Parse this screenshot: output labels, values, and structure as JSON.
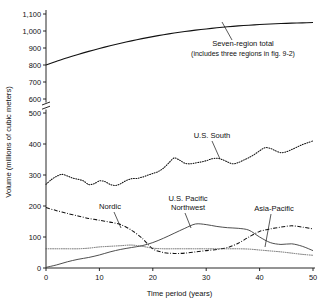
{
  "chart_data": {
    "type": "line",
    "title": "",
    "xlabel": "Time period (years)",
    "ylabel": "Volume (millions of cubic meters)",
    "xlim": [
      0,
      50
    ],
    "xticks": [
      "0",
      "10",
      "20",
      "30",
      "40",
      "50"
    ],
    "xtick_values": [
      0,
      10,
      20,
      30,
      40,
      50
    ],
    "yticks_lower": [
      "0",
      "100",
      "200",
      "300",
      "400",
      "500"
    ],
    "ytick_values_lower": [
      0,
      100,
      200,
      300,
      400,
      500
    ],
    "yticks_upper": [
      "600",
      "700",
      "800",
      "900",
      "1,000",
      "1,100"
    ],
    "ytick_values_upper": [
      600,
      700,
      800,
      900,
      1000,
      1100
    ],
    "axis_break": true,
    "axis_break_between": [
      500,
      600
    ],
    "grid": false,
    "legend_position": "inline-annotations",
    "annotations": [
      {
        "name": "seven-region-total",
        "line1": "Seven-region total",
        "line2": "(includes three regions in fig. 9-2)"
      },
      {
        "name": "us-south",
        "line1": "U.S. South"
      },
      {
        "name": "nordic",
        "line1": "Nordic"
      },
      {
        "name": "us-pacific-northwest",
        "line1": "U.S. Pacific",
        "line2": "Northwest"
      },
      {
        "name": "asia-pacific",
        "line1": "Asia-Pacific"
      }
    ],
    "series": [
      {
        "name": "Seven-region total",
        "style": "solid",
        "x": [
          0,
          2,
          4,
          6,
          8,
          10,
          12,
          14,
          16,
          18,
          20,
          22,
          24,
          26,
          28,
          30,
          32,
          34,
          36,
          38,
          40,
          42,
          44,
          46,
          48,
          50
        ],
        "values": [
          800,
          822,
          843,
          862,
          880,
          897,
          913,
          928,
          942,
          955,
          967,
          978,
          988,
          997,
          1005,
          1012,
          1019,
          1025,
          1030,
          1034,
          1038,
          1041,
          1044,
          1046,
          1048,
          1050
        ]
      },
      {
        "name": "U.S. South",
        "style": "dotted",
        "x": [
          0,
          1,
          2,
          3,
          4,
          5,
          6,
          7,
          8,
          9,
          10,
          11,
          12,
          13,
          14,
          15,
          16,
          17,
          18,
          19,
          20,
          21,
          22,
          23,
          24,
          25,
          26,
          27,
          28,
          29,
          30,
          31,
          32,
          33,
          34,
          35,
          36,
          37,
          38,
          39,
          40,
          41,
          42,
          43,
          44,
          45,
          46,
          47,
          48,
          49,
          50
        ],
        "values": [
          270,
          285,
          296,
          302,
          297,
          290,
          286,
          281,
          269,
          272,
          281,
          279,
          270,
          266,
          272,
          282,
          288,
          289,
          293,
          299,
          305,
          311,
          322,
          339,
          355,
          348,
          338,
          336,
          339,
          342,
          346,
          352,
          354,
          350,
          342,
          336,
          340,
          348,
          356,
          366,
          378,
          388,
          386,
          378,
          372,
          375,
          382,
          390,
          398,
          404,
          410
        ]
      },
      {
        "name": "Nordic",
        "style": "dash-dot",
        "x": [
          0,
          2,
          4,
          6,
          8,
          10,
          12,
          14,
          16,
          18,
          20,
          22,
          24,
          26,
          28,
          30,
          32,
          34,
          36,
          38,
          40,
          42,
          44,
          46,
          48,
          50
        ],
        "values": [
          195,
          185,
          176,
          168,
          160,
          154,
          148,
          140,
          122,
          96,
          62,
          50,
          47,
          48,
          52,
          56,
          60,
          66,
          80,
          100,
          118,
          126,
          132,
          136,
          132,
          126
        ]
      },
      {
        "name": "U.S. Pacific Northwest",
        "style": "solid",
        "x": [
          0,
          2,
          4,
          6,
          8,
          10,
          12,
          14,
          16,
          18,
          20,
          22,
          24,
          26,
          28,
          30,
          32,
          34,
          36,
          38,
          40,
          42,
          44,
          46,
          48,
          50
        ],
        "values": [
          2,
          10,
          20,
          28,
          34,
          42,
          52,
          60,
          66,
          72,
          82,
          96,
          112,
          128,
          142,
          140,
          134,
          130,
          128,
          122,
          100,
          82,
          76,
          78,
          70,
          56
        ]
      },
      {
        "name": "Asia-Pacific",
        "style": "dotted",
        "x": [
          0,
          2,
          4,
          6,
          8,
          10,
          12,
          14,
          16,
          18,
          20,
          22,
          24,
          26,
          28,
          30,
          32,
          34,
          36,
          38,
          40,
          42,
          44,
          46,
          48,
          50
        ],
        "values": [
          62,
          62,
          62,
          62,
          64,
          68,
          70,
          72,
          74,
          70,
          64,
          62,
          62,
          62,
          62,
          62,
          62,
          62,
          62,
          61,
          58,
          55,
          52,
          48,
          44,
          41
        ]
      }
    ]
  }
}
